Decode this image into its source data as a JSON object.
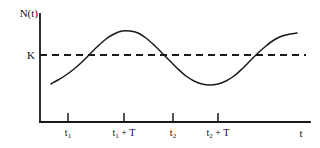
{
  "chart_data": {
    "type": "line",
    "title": "",
    "subtitle": "",
    "xlabel": "t",
    "ylabel": "N(t)",
    "grid": false,
    "legend": null,
    "xlim": [
      0,
      320
    ],
    "ylim": [
      0,
      148
    ],
    "axes": {
      "y_axis_label": "N(t)",
      "x_axis_label": "t",
      "origin_px": [
        40,
        122
      ],
      "x_axis_end_px": [
        310,
        122
      ],
      "y_axis_top_px": [
        40,
        14
      ]
    },
    "reference_line": {
      "label": "K",
      "style": "dashed",
      "orientation": "horizontal",
      "y_px": 55,
      "x_start_px": 40,
      "x_end_px": 306,
      "dash_on_px": 7,
      "dash_off_px": 5,
      "color": "#1a1a1a",
      "description": "carrying capacity K"
    },
    "tick_labels": [
      "t1",
      "t1 + T",
      "t2",
      "t2 + T"
    ],
    "ticks": [
      {
        "label": "t",
        "sub": "1",
        "suffix": "",
        "x_px": 68,
        "has_mark": true
      },
      {
        "label": "t",
        "sub": "1",
        "suffix": " + T",
        "x_px": 124,
        "has_mark": true
      },
      {
        "label": "t",
        "sub": "2",
        "suffix": "",
        "x_px": 173,
        "has_mark": true
      },
      {
        "label": "t",
        "sub": "2",
        "suffix": " + T",
        "x_px": 218,
        "has_mark": true
      }
    ],
    "series": [
      {
        "name": "N(t)",
        "color": "#1a1a1a",
        "style": "solid",
        "description": "population oscillating about carrying capacity K",
        "points_px": [
          [
            51,
            84
          ],
          [
            58,
            80
          ],
          [
            66,
            75
          ],
          [
            74,
            69
          ],
          [
            82,
            62
          ],
          [
            90,
            54
          ],
          [
            98,
            46
          ],
          [
            106,
            39
          ],
          [
            114,
            34
          ],
          [
            122,
            31
          ],
          [
            130,
            31
          ],
          [
            138,
            33
          ],
          [
            146,
            38
          ],
          [
            154,
            45
          ],
          [
            162,
            53
          ],
          [
            170,
            61
          ],
          [
            178,
            69
          ],
          [
            186,
            76
          ],
          [
            194,
            81
          ],
          [
            202,
            84
          ],
          [
            210,
            85
          ],
          [
            218,
            84
          ],
          [
            226,
            81
          ],
          [
            234,
            76
          ],
          [
            242,
            69
          ],
          [
            250,
            61
          ],
          [
            258,
            53
          ],
          [
            266,
            46
          ],
          [
            274,
            40
          ],
          [
            282,
            36
          ],
          [
            290,
            34
          ],
          [
            297,
            33
          ]
        ],
        "crossings_of_K_px": [
          88,
          165,
          262
        ],
        "peak_px": [
          126,
          31
        ],
        "trough_px": [
          215,
          85
        ],
        "start_px": [
          51,
          84
        ],
        "end_px": [
          297,
          33
        ]
      }
    ],
    "annotations": []
  },
  "figure": {
    "background": "#ffffff",
    "stroke_color": "#1a1a1a",
    "axis_width_px": 1.6,
    "curve_width_px": 1.4,
    "dash_width_px": 1.8
  }
}
